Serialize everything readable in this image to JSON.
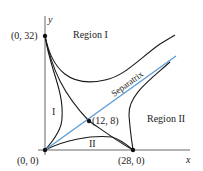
{
  "diagram": {
    "type": "phase-plane",
    "axes": {
      "x_label": "x",
      "y_label": "y"
    },
    "equilibria": [
      {
        "label": "(0, 0)",
        "x": 0,
        "y": 0
      },
      {
        "label": "(0, 32)",
        "x": 0,
        "y": 32
      },
      {
        "label": "(12, 8)",
        "x": 12,
        "y": 8
      },
      {
        "label": "(28, 0)",
        "x": 28,
        "y": 0
      }
    ],
    "regions": {
      "region_1": "Region I",
      "region_2": "Region II",
      "sub_1": "I",
      "sub_2": "II"
    },
    "separatrix_label": "Separatrix",
    "colors": {
      "separatrix": "#5b9bd5",
      "curve": "#1a1a1a",
      "axis": "#555555"
    }
  }
}
